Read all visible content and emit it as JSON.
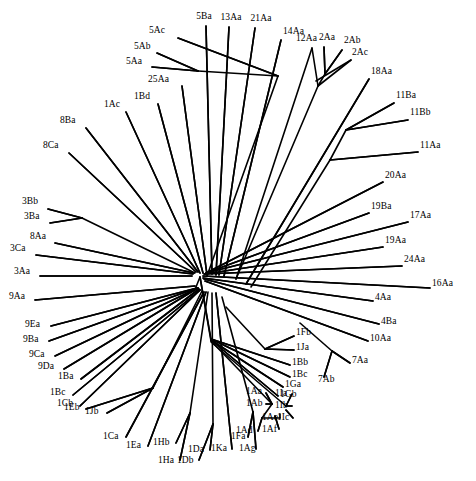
{
  "figure": {
    "type": "unrooted-phylogenetic-tree",
    "title": "",
    "background_color": "#ffffff",
    "line_color": "#000000",
    "text_color": "#000000",
    "width": 476,
    "height": 481,
    "root_node": {
      "x": 200,
      "y": 277
    }
  },
  "chart_data": {
    "type": "diagram",
    "title": "",
    "xlabel": "",
    "ylabel": "",
    "tree_type": "unrooted radial phylogram",
    "taxa_count": 62,
    "taxa": [
      "5Ac",
      "5Ba",
      "13Aa",
      "21Aa",
      "14Aa",
      "12Aa",
      "2Aa",
      "2Ab",
      "2Ac",
      "5Ab",
      "5Aa",
      "25Aa",
      "18Aa",
      "11Ba",
      "11Bb",
      "11Aa",
      "1Ac",
      "1Bd",
      "8Ba",
      "8Ca",
      "20Aa",
      "19Ba",
      "17Aa",
      "19Aa",
      "24Aa",
      "3Bb",
      "3Ba",
      "8Aa",
      "3Ca",
      "3Aa",
      "16Aa",
      "9Aa",
      "4Aa",
      "4Ba",
      "9Ea",
      "9Ba",
      "9Ca",
      "9Da",
      "10Aa",
      "1Ba",
      "1Fb",
      "1Ja",
      "1Bc",
      "1Cb",
      "1Bb",
      "1Bc2",
      "1Ga",
      "1Gb",
      "7Aa",
      "7Ab",
      "1Eb",
      "1Jb",
      "1Aa",
      "1Ab",
      "1Ia",
      "1Ib",
      "1Ae",
      "1Ic",
      "1Ca",
      "1Ea",
      "1Hb",
      "1Da",
      "1Ka",
      "1Fa",
      "1Ag",
      "1Ad",
      "1Af",
      "1Ha",
      "1Db"
    ]
  },
  "leaves": [
    {
      "label": "5Ac",
      "lx": 149,
      "ly": 31,
      "anchor": "start",
      "tx": 178,
      "ty": 38,
      "ex": 278,
      "ey": 76
    },
    {
      "label": "5Ba",
      "lx": 204,
      "ly": 17,
      "anchor": "mid",
      "tx": 206,
      "ty": 26,
      "ex": 212,
      "ey": 274
    },
    {
      "label": "13Aa",
      "lx": 231,
      "ly": 18,
      "anchor": "mid",
      "tx": 229,
      "ty": 27,
      "ex": 216,
      "ey": 275
    },
    {
      "label": "21Aa",
      "lx": 261,
      "ly": 19,
      "anchor": "mid",
      "tx": 255,
      "ty": 28,
      "ex": 219,
      "ey": 275
    },
    {
      "label": "14Aa",
      "lx": 283,
      "ly": 32,
      "anchor": "start",
      "tx": 281,
      "ty": 40,
      "ex": 224,
      "ey": 276
    },
    {
      "label": "12Aa",
      "lx": 296,
      "ly": 39,
      "anchor": "start",
      "tx": 312,
      "ty": 48,
      "ex": 236,
      "ey": 279
    },
    {
      "label": "2Aa",
      "lx": 319,
      "ly": 38,
      "anchor": "start",
      "tx": 324,
      "ty": 47,
      "ex": 325,
      "ey": 74
    },
    {
      "label": "2Ab",
      "lx": 344,
      "ly": 41,
      "anchor": "start",
      "tx": 342,
      "ty": 50,
      "ex": 325,
      "ey": 74
    },
    {
      "label": "2Ac",
      "lx": 352,
      "ly": 53,
      "anchor": "start",
      "tx": 351,
      "ty": 60,
      "ex": 316,
      "ey": 81
    },
    {
      "label": "5Ab",
      "lx": 134,
      "ly": 47,
      "anchor": "start",
      "tx": 157,
      "ty": 53,
      "ex": 198,
      "ey": 71
    },
    {
      "label": "5Aa",
      "lx": 126,
      "ly": 62,
      "anchor": "start",
      "tx": 152,
      "ty": 67,
      "ex": 198,
      "ey": 71
    },
    {
      "label": "25Aa",
      "lx": 148,
      "ly": 80,
      "anchor": "start",
      "tx": 182,
      "ty": 86,
      "ex": 207,
      "ey": 275
    },
    {
      "label": "18Aa",
      "lx": 371,
      "ly": 72,
      "anchor": "start",
      "tx": 369,
      "ty": 79,
      "ex": 246,
      "ey": 284
    },
    {
      "label": "11Ba",
      "lx": 396,
      "ly": 96,
      "anchor": "start",
      "tx": 394,
      "ty": 103,
      "ex": 346,
      "ey": 130
    },
    {
      "label": "11Bb",
      "lx": 410,
      "ly": 113,
      "anchor": "start",
      "tx": 408,
      "ty": 120,
      "ex": 346,
      "ey": 130
    },
    {
      "label": "11Aa",
      "lx": 420,
      "ly": 146,
      "anchor": "start",
      "tx": 418,
      "ty": 152,
      "ex": 330,
      "ey": 160
    },
    {
      "label": "1Ac",
      "lx": 104,
      "ly": 105,
      "anchor": "start",
      "tx": 126,
      "ty": 112,
      "ex": 200,
      "ey": 273
    },
    {
      "label": "1Bd",
      "lx": 134,
      "ly": 97,
      "anchor": "start",
      "tx": 158,
      "ty": 104,
      "ex": 203,
      "ey": 273
    },
    {
      "label": "8Ba",
      "lx": 60,
      "ly": 121,
      "anchor": "start",
      "tx": 86,
      "ty": 128,
      "ex": 198,
      "ey": 272
    },
    {
      "label": "8Ca",
      "lx": 43,
      "ly": 146,
      "anchor": "start",
      "tx": 69,
      "ty": 153,
      "ex": 196,
      "ey": 272
    },
    {
      "label": "20Aa",
      "lx": 385,
      "ly": 176,
      "anchor": "start",
      "tx": 383,
      "ty": 182,
      "ex": 208,
      "ey": 272
    },
    {
      "label": "19Ba",
      "lx": 371,
      "ly": 207,
      "anchor": "start",
      "tx": 369,
      "ty": 213,
      "ex": 206,
      "ey": 273
    },
    {
      "label": "17Aa",
      "lx": 410,
      "ly": 216,
      "anchor": "start",
      "tx": 408,
      "ty": 222,
      "ex": 206,
      "ey": 273
    },
    {
      "label": "19Aa",
      "lx": 385,
      "ly": 241,
      "anchor": "start",
      "tx": 383,
      "ty": 247,
      "ex": 205,
      "ey": 274
    },
    {
      "label": "24Aa",
      "lx": 404,
      "ly": 260,
      "anchor": "start",
      "tx": 402,
      "ty": 266,
      "ex": 204,
      "ey": 274
    },
    {
      "label": "3Bb",
      "lx": 22,
      "ly": 202,
      "anchor": "start",
      "tx": 48,
      "ty": 209,
      "ex": 82,
      "ey": 218
    },
    {
      "label": "3Ba",
      "lx": 24,
      "ly": 217,
      "anchor": "start",
      "tx": 50,
      "ty": 223,
      "ex": 82,
      "ey": 218
    },
    {
      "label": "8Aa",
      "lx": 30,
      "ly": 237,
      "anchor": "start",
      "tx": 55,
      "ty": 243,
      "ex": 194,
      "ey": 273
    },
    {
      "label": "3Ca",
      "lx": 10,
      "ly": 249,
      "anchor": "start",
      "tx": 36,
      "ty": 255,
      "ex": 193,
      "ey": 274
    },
    {
      "label": "3Aa",
      "lx": 14,
      "ly": 272,
      "anchor": "start",
      "tx": 40,
      "ty": 276,
      "ex": 192,
      "ey": 276
    },
    {
      "label": "16Aa",
      "lx": 432,
      "ly": 284,
      "anchor": "start",
      "tx": 430,
      "ty": 288,
      "ex": 203,
      "ey": 276
    },
    {
      "label": "9Aa",
      "lx": 9,
      "ly": 297,
      "anchor": "start",
      "tx": 35,
      "ty": 300,
      "ex": 195,
      "ey": 286
    },
    {
      "label": "4Aa",
      "lx": 375,
      "ly": 298,
      "anchor": "start",
      "tx": 373,
      "ty": 301,
      "ex": 203,
      "ey": 278
    },
    {
      "label": "4Ba",
      "lx": 381,
      "ly": 322,
      "anchor": "start",
      "tx": 379,
      "ty": 324,
      "ex": 204,
      "ey": 279
    },
    {
      "label": "9Ea",
      "lx": 25,
      "ly": 325,
      "anchor": "start",
      "tx": 51,
      "ty": 326,
      "ex": 197,
      "ey": 288
    },
    {
      "label": "9Ba",
      "lx": 23,
      "ly": 340,
      "anchor": "start",
      "tx": 49,
      "ty": 341,
      "ex": 197,
      "ey": 288
    },
    {
      "label": "9Ca",
      "lx": 29,
      "ly": 355,
      "anchor": "start",
      "tx": 55,
      "ty": 356,
      "ex": 198,
      "ey": 288
    },
    {
      "label": "9Da",
      "lx": 38,
      "ly": 367,
      "anchor": "start",
      "tx": 64,
      "ty": 369,
      "ex": 198,
      "ey": 288
    },
    {
      "label": "10Aa",
      "lx": 370,
      "ly": 339,
      "anchor": "start",
      "tx": 368,
      "ty": 341,
      "ex": 205,
      "ey": 281
    },
    {
      "label": "1Ba",
      "lx": 58,
      "ly": 377,
      "anchor": "start",
      "tx": 81,
      "ty": 379,
      "ex": 199,
      "ey": 289
    },
    {
      "label": "1Fb",
      "lx": 296,
      "ly": 333,
      "anchor": "start",
      "tx": 294,
      "ty": 336,
      "ex": 265,
      "ey": 349
    },
    {
      "label": "1Ja",
      "lx": 296,
      "ly": 348,
      "anchor": "start",
      "tx": 294,
      "ty": 350,
      "ex": 265,
      "ey": 349
    },
    {
      "label": "1Bb",
      "lx": 292,
      "ly": 363,
      "anchor": "start",
      "tx": 290,
      "ty": 365,
      "ex": 211,
      "ey": 339
    },
    {
      "label": "1Bc",
      "lx": 292,
      "ly": 375,
      "anchor": "start",
      "tx": 290,
      "ty": 377,
      "ex": 211,
      "ey": 339
    },
    {
      "label": "1Ga",
      "lx": 285,
      "ly": 385,
      "anchor": "start",
      "tx": 283,
      "ty": 387,
      "ex": 211,
      "ey": 340
    },
    {
      "label": "1Gb",
      "lx": 280,
      "ly": 395,
      "anchor": "start",
      "tx": 278,
      "ty": 396,
      "ex": 211,
      "ey": 340
    },
    {
      "label": "7Aa",
      "lx": 352,
      "ly": 361,
      "anchor": "start",
      "tx": 350,
      "ty": 363,
      "ex": 332,
      "ey": 351
    },
    {
      "label": "7Ab",
      "lx": 318,
      "ly": 380,
      "anchor": "start",
      "tx": 324,
      "ty": 377,
      "ex": 332,
      "ey": 351
    },
    {
      "label": "1Eb",
      "lx": 64,
      "ly": 408,
      "anchor": "start",
      "tx": 86,
      "ty": 409,
      "ex": 153,
      "ey": 388
    },
    {
      "label": "1Jb",
      "lx": 85,
      "ly": 412,
      "anchor": "start",
      "tx": 107,
      "ty": 413,
      "ex": 153,
      "ey": 388
    },
    {
      "label": "1Bc",
      "lx": 50,
      "ly": 393,
      "anchor": "start",
      "tx": 73,
      "ty": 395,
      "ex": 200,
      "ey": 290
    },
    {
      "label": "1Cb",
      "lx": 57,
      "ly": 404,
      "anchor": "start",
      "tx": 80,
      "ty": 406,
      "ex": 200,
      "ey": 290
    },
    {
      "label": "1Ca",
      "lx": 103,
      "ly": 437,
      "anchor": "start",
      "tx": 126,
      "ty": 437,
      "ex": 204,
      "ey": 292
    },
    {
      "label": "1Ea",
      "lx": 126,
      "ly": 446,
      "anchor": "start",
      "tx": 148,
      "ty": 446,
      "ex": 206,
      "ey": 292
    },
    {
      "label": "1Hb",
      "lx": 153,
      "ly": 443,
      "anchor": "start",
      "tx": 176,
      "ty": 443,
      "ex": 190,
      "ey": 413
    },
    {
      "label": "1Ha",
      "lx": 158,
      "ly": 461,
      "anchor": "start",
      "tx": 180,
      "ty": 460,
      "ex": 190,
      "ey": 413
    },
    {
      "label": "1Da",
      "lx": 188,
      "ly": 450,
      "anchor": "start",
      "tx": 210,
      "ty": 450,
      "ex": 213,
      "ey": 424
    },
    {
      "label": "1Db",
      "lx": 177,
      "ly": 461,
      "anchor": "start",
      "tx": 199,
      "ty": 460,
      "ex": 213,
      "ey": 424
    },
    {
      "label": "1Ka",
      "lx": 211,
      "ly": 449,
      "anchor": "start",
      "tx": 232,
      "ty": 449,
      "ex": 216,
      "ey": 293
    },
    {
      "label": "1Fa",
      "lx": 231,
      "ly": 437,
      "anchor": "start",
      "tx": 248,
      "ty": 437,
      "ex": 253,
      "ey": 412
    },
    {
      "label": "1Ag",
      "lx": 239,
      "ly": 449,
      "anchor": "start",
      "tx": 256,
      "ty": 449,
      "ex": 253,
      "ey": 412
    },
    {
      "label": "1Ad",
      "lx": 236,
      "ly": 431,
      "anchor": "start",
      "tx": 258,
      "ty": 431,
      "ex": 262,
      "ey": 418
    },
    {
      "label": "1Af",
      "lx": 262,
      "ly": 430,
      "anchor": "start",
      "tx": 279,
      "ty": 429,
      "ex": 275,
      "ey": 416
    },
    {
      "label": "1Aa",
      "lx": 246,
      "ly": 392,
      "anchor": "start",
      "tx": 266,
      "ty": 393,
      "ex": 272,
      "ey": 404
    },
    {
      "label": "1Ab",
      "lx": 246,
      "ly": 404,
      "anchor": "start",
      "tx": 266,
      "ty": 404,
      "ex": 272,
      "ey": 404
    },
    {
      "label": "1Ae",
      "lx": 262,
      "ly": 418,
      "anchor": "start",
      "tx": 280,
      "ty": 418,
      "ex": 280,
      "ey": 414
    },
    {
      "label": "1Ia",
      "lx": 275,
      "ly": 394,
      "anchor": "start",
      "tx": 292,
      "ty": 394,
      "ex": 286,
      "ey": 406
    },
    {
      "label": "1Ib",
      "lx": 275,
      "ly": 406,
      "anchor": "start",
      "tx": 292,
      "ty": 406,
      "ex": 286,
      "ey": 406
    },
    {
      "label": "1Ic",
      "lx": 277,
      "ly": 418,
      "anchor": "start",
      "tx": 293,
      "ty": 418,
      "ex": 286,
      "ey": 410
    }
  ],
  "branches": [
    {
      "id": "b-5Ac",
      "d": "M 278,76 L 178,38"
    },
    {
      "id": "b-5sub",
      "d": "M 207,276 L 278,76"
    },
    {
      "id": "b-5Ab",
      "d": "M 198,71 L 157,53"
    },
    {
      "id": "b-5Aa",
      "d": "M 198,71 L 152,67"
    },
    {
      "id": "b-5int",
      "d": "M 198,71 L 278,76"
    },
    {
      "id": "b-25Aa",
      "d": "M 207,275 L 182,86"
    },
    {
      "id": "b-5Ba",
      "d": "M 212,274 L 206,26"
    },
    {
      "id": "b-13Aa",
      "d": "M 216,275 L 229,27"
    },
    {
      "id": "b-21Aa",
      "d": "M 219,275 L 255,28"
    },
    {
      "id": "b-14Aa",
      "d": "M 224,276 L 281,40"
    },
    {
      "id": "b-12node",
      "d": "M 236,279 L 318,86"
    },
    {
      "id": "b-12Aa",
      "d": "M 318,86 L 312,48"
    },
    {
      "id": "b-2node",
      "d": "M 318,86 L 325,74"
    },
    {
      "id": "b-2Aa",
      "d": "M 325,74 L 324,47"
    },
    {
      "id": "b-2Ab",
      "d": "M 325,74 L 342,50"
    },
    {
      "id": "b-2Ac",
      "d": "M 318,86 L 351,60"
    },
    {
      "id": "b-18Aa",
      "d": "M 246,284 L 369,79"
    },
    {
      "id": "b-11root",
      "d": "M 251,287 L 330,160"
    },
    {
      "id": "b-11Bnd",
      "d": "M 330,160 L 346,130"
    },
    {
      "id": "b-11Ba",
      "d": "M 346,130 L 394,103"
    },
    {
      "id": "b-11Bb",
      "d": "M 346,130 L 408,120"
    },
    {
      "id": "b-11Aa",
      "d": "M 330,160 L 418,152"
    },
    {
      "id": "b-1Ac",
      "d": "M 200,273 L 126,112"
    },
    {
      "id": "b-1Bd",
      "d": "M 203,273 L 158,104"
    },
    {
      "id": "b-8Ba",
      "d": "M 198,272 L 86,128"
    },
    {
      "id": "b-8Ca",
      "d": "M 196,272 L 69,153"
    },
    {
      "id": "b-20Aa",
      "d": "M 208,272 L 383,182"
    },
    {
      "id": "b-19Ba",
      "d": "M 206,273 L 369,213"
    },
    {
      "id": "b-17Aa",
      "d": "M 206,273 L 408,222"
    },
    {
      "id": "b-19Aa",
      "d": "M 205,274 L 383,247"
    },
    {
      "id": "b-24Aa",
      "d": "M 204,274 L 402,266"
    },
    {
      "id": "b-3Bnode",
      "d": "M 195,273 L 82,218"
    },
    {
      "id": "b-3Bb",
      "d": "M 82,218 L 48,209"
    },
    {
      "id": "b-3Ba",
      "d": "M 82,218 L 50,223"
    },
    {
      "id": "b-8Aa",
      "d": "M 194,273 L 55,243"
    },
    {
      "id": "b-3Ca",
      "d": "M 193,274 L 36,255"
    },
    {
      "id": "b-3Aa",
      "d": "M 192,276 L 40,276"
    },
    {
      "id": "b-16Aa",
      "d": "M 203,276 L 430,288"
    },
    {
      "id": "b-9Aa",
      "d": "M 195,286 L 35,300"
    },
    {
      "id": "b-4Aa",
      "d": "M 203,278 L 373,301"
    },
    {
      "id": "b-4Ba",
      "d": "M 204,279 L 379,324"
    },
    {
      "id": "b-9node",
      "d": "M 196,287 L 197,288"
    },
    {
      "id": "b-9Ea",
      "d": "M 197,288 L 51,326"
    },
    {
      "id": "b-9Ba",
      "d": "M 197,288 L 49,341"
    },
    {
      "id": "b-9Ca",
      "d": "M 198,288 L 55,356"
    },
    {
      "id": "b-9Da",
      "d": "M 198,288 L 64,369"
    },
    {
      "id": "b-10Aa",
      "d": "M 205,281 L 368,341"
    },
    {
      "id": "b-1Ba",
      "d": "M 199,289 L 81,379"
    },
    {
      "id": "b-1Bcl",
      "d": "M 200,290 L 73,395"
    },
    {
      "id": "b-1Cb",
      "d": "M 200,290 L 80,406"
    },
    {
      "id": "b-1EJnd",
      "d": "M 202,291 L 153,388"
    },
    {
      "id": "b-1Eb",
      "d": "M 153,388 L 86,409"
    },
    {
      "id": "b-1Jb",
      "d": "M 153,388 L 107,413"
    },
    {
      "id": "b-1Ca",
      "d": "M 204,292 L 126,437"
    },
    {
      "id": "b-1Ea",
      "d": "M 206,292 L 148,446"
    },
    {
      "id": "b-1Hnd",
      "d": "M 208,292 L 190,413"
    },
    {
      "id": "b-1Hb",
      "d": "M 190,413 L 176,443"
    },
    {
      "id": "b-1Ha",
      "d": "M 190,413 L 180,460"
    },
    {
      "id": "b-1Dnd",
      "d": "M 212,293 L 213,424"
    },
    {
      "id": "b-1Da",
      "d": "M 213,424 L 210,450"
    },
    {
      "id": "b-1Db",
      "d": "M 213,424 L 199,460"
    },
    {
      "id": "b-1Ka",
      "d": "M 216,293 L 232,449"
    },
    {
      "id": "b-1Fnd",
      "d": "M 222,297 L 253,412"
    },
    {
      "id": "b-1Fa",
      "d": "M 253,412 L 248,437"
    },
    {
      "id": "b-1Ag",
      "d": "M 253,412 L 256,449"
    },
    {
      "id": "b-1FBnd",
      "d": "M 226,307 L 265,349"
    },
    {
      "id": "b-1Fb",
      "d": "M 265,349 L 294,336"
    },
    {
      "id": "b-1Ja",
      "d": "M 265,349 L 294,350"
    },
    {
      "id": "b-1Bb",
      "d": "M 211,339 L 290,365"
    },
    {
      "id": "b-1Bc2",
      "d": "M 211,339 L 290,377"
    },
    {
      "id": "b-1Ga",
      "d": "M 211,340 L 283,387"
    },
    {
      "id": "b-1Gb",
      "d": "M 211,340 L 278,396"
    },
    {
      "id": "b-7nd",
      "d": "M 300,323 L 332,351"
    },
    {
      "id": "b-7Aa",
      "d": "M 332,351 L 350,363"
    },
    {
      "id": "b-7Ab",
      "d": "M 332,351 L 324,377"
    },
    {
      "id": "b-1Anode",
      "d": "M 211,341 L 272,404"
    },
    {
      "id": "b-1Aa",
      "d": "M 272,404 L 266,393"
    },
    {
      "id": "b-1Ab",
      "d": "M 272,404 L 266,404"
    },
    {
      "id": "b-1Aint",
      "d": "M 272,404 L 262,418"
    },
    {
      "id": "b-1Ad",
      "d": "M 262,418 L 258,431"
    },
    {
      "id": "b-1Ae",
      "d": "M 262,418 L 280,418"
    },
    {
      "id": "b-1Af",
      "d": "M 275,416 L 279,429"
    },
    {
      "id": "b-1Inode",
      "d": "M 211,342 L 286,406"
    },
    {
      "id": "b-1Ia",
      "d": "M 286,406 L 292,394"
    },
    {
      "id": "b-1Ib",
      "d": "M 286,406 L 292,406"
    },
    {
      "id": "b-1Ic",
      "d": "M 286,410 L 293,418"
    },
    {
      "id": "b-core1",
      "d": "M 200,277 L 211,339"
    },
    {
      "id": "b-core2",
      "d": "M 200,277 L 211,341"
    },
    {
      "id": "b-core3",
      "d": "M 200,277 L 196,287"
    }
  ]
}
